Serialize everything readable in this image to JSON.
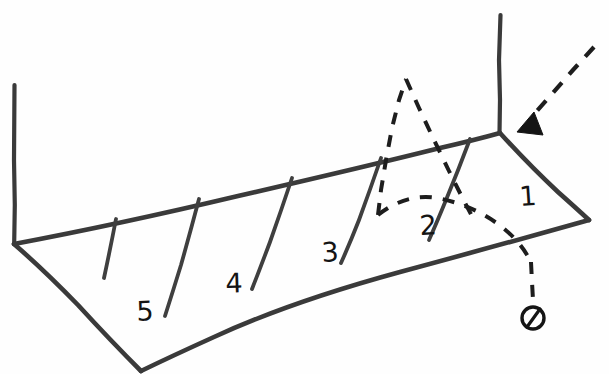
{
  "canvas": {
    "width": 609,
    "height": 374,
    "background_color": "#fefefe",
    "ink_color": "#3a3a3a",
    "style": "hand-drawn pencil sketch"
  },
  "court": {
    "name": "court-surface",
    "zone_count": 5,
    "far_edge_color": "#3a3a3a",
    "near_edge_color": "#3a3a3a"
  },
  "zones": [
    {
      "label": "1",
      "x": 528,
      "y": 196,
      "rotation": -4
    },
    {
      "label": "2",
      "x": 428,
      "y": 225,
      "rotation": -3
    },
    {
      "label": "3",
      "x": 330,
      "y": 252,
      "rotation": -3
    },
    {
      "label": "4",
      "x": 234,
      "y": 283,
      "rotation": -2
    },
    {
      "label": "5",
      "x": 145,
      "y": 311,
      "rotation": -2
    }
  ],
  "posts": [
    {
      "name": "left-net-post",
      "x": 14,
      "y_top": 85,
      "y_bottom": 243
    },
    {
      "name": "right-net-post",
      "x": 500,
      "y_top": 15,
      "y_bottom": 133
    }
  ],
  "trajectory": {
    "name": "ball-trajectory",
    "style": "dashed",
    "color": "#1d1d1d",
    "incoming_label": "incoming serve path",
    "outgoing_label": "ball arc over net",
    "arrow_direction": "down-left",
    "ball_marker": "crossed-circle"
  },
  "colors": {
    "ink": "#3a3a3a",
    "dash": "#1d1d1d",
    "paper": "#fefefe",
    "label": "#141414"
  }
}
